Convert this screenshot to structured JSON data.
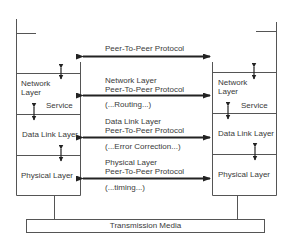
{
  "diagram": {
    "type": "OSI lower layers peer-to-peer communication",
    "left_stack": {
      "layers": [
        {
          "name": "Network Layer",
          "lines": [
            "Network",
            "Layer"
          ]
        },
        {
          "name": "Data Link Layer",
          "lines": [
            "Data Link Layer"
          ]
        },
        {
          "name": "Physical Layer",
          "lines": [
            "Physical Layer"
          ]
        }
      ],
      "service_label": "Service"
    },
    "right_stack": {
      "layers": [
        {
          "name": "Network Layer",
          "lines": [
            "Network",
            "Layer"
          ]
        },
        {
          "name": "Data Link Layer",
          "lines": [
            "Data Link Layer"
          ]
        },
        {
          "name": "Physical Layer",
          "lines": [
            "Physical Layer"
          ]
        }
      ],
      "service_label": "Service"
    },
    "protocols": [
      {
        "line1": "Peer-To-Peer Protocol",
        "line2": "",
        "note": ""
      },
      {
        "line1": "Network Layer",
        "line2": "Peer-To-Peer Protocol",
        "note": "(...Routing...)"
      },
      {
        "line1": "Data Link Layer",
        "line2": "Peer-To-Peer Protocol",
        "note": "(...Error Correction...)"
      },
      {
        "line1": "Physical Layer",
        "line2": "Peer-To-Peer Protocol",
        "note": "(...timing...)"
      }
    ],
    "media": {
      "label": "Transmission Media"
    },
    "colors": {
      "line": "#555555",
      "arrow": "#222222",
      "text": "#3a3a3a",
      "background": "#ffffff"
    }
  }
}
